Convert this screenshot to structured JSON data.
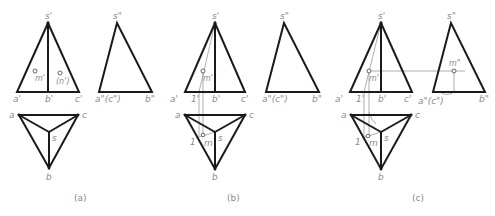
{
  "figure": {
    "colors": {
      "outline": "#1a1a1a",
      "construction": "#9a9a9a",
      "label": "#8a8a8a",
      "background": "#ffffff"
    },
    "panels": [
      {
        "id": "a",
        "caption": "(a)",
        "front_view": {
          "apex": "s'",
          "base_left": "a'",
          "base_mid": "b'",
          "base_right": "c'",
          "points": [
            "m'",
            "(n')"
          ]
        },
        "side_view": {
          "apex": "s\"",
          "base_left": "a\"(c\")",
          "base_right": "b\""
        },
        "top_view": {
          "a": "a",
          "b": "b",
          "c": "c",
          "s": "s"
        }
      },
      {
        "id": "b",
        "caption": "(b)",
        "front_view": {
          "apex": "s'",
          "base_left": "a'",
          "aux": "1'",
          "base_mid": "b'",
          "base_right": "c'",
          "points": [
            "m'"
          ]
        },
        "side_view": {
          "apex": "s\"",
          "base_left": "a\"(c\")",
          "base_right": "b\""
        },
        "top_view": {
          "a": "a",
          "b": "b",
          "c": "c",
          "s": "s",
          "aux": "1",
          "point": "m"
        }
      },
      {
        "id": "c",
        "caption": "(c)",
        "front_view": {
          "apex": "s'",
          "base_left": "a'",
          "aux": "1'",
          "base_mid": "b'",
          "base_right": "c'",
          "points": [
            "m'"
          ]
        },
        "side_view": {
          "apex": "s\"",
          "base_left": "a\"(c\")",
          "base_right": "b\"",
          "points": [
            "m\""
          ]
        },
        "top_view": {
          "a": "a",
          "b": "b",
          "c": "c",
          "s": "s",
          "aux": "1",
          "point": "m"
        }
      }
    ]
  }
}
